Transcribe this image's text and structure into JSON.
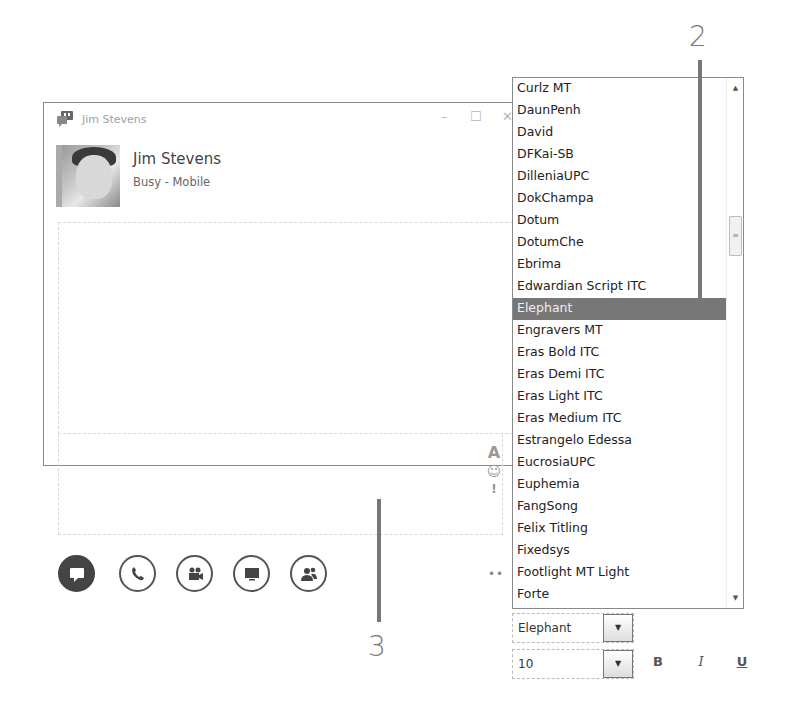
{
  "window": {
    "title": "Jim Stevens",
    "controls": {
      "minimize": "–",
      "maximize": "☐",
      "close": "✕"
    }
  },
  "contact": {
    "name": "Jim Stevens",
    "status": "Busy - Mobile"
  },
  "side_tools": {
    "font": "A",
    "emoticon": "☺",
    "importance": "!"
  },
  "action_buttons": [
    {
      "name": "im-button",
      "icon": "speech-bubble",
      "glyph": "▬",
      "active": true
    },
    {
      "name": "call-button",
      "icon": "phone",
      "glyph": "✆",
      "active": false
    },
    {
      "name": "video-button",
      "icon": "video-camera",
      "glyph": "▰",
      "active": false
    },
    {
      "name": "present-button",
      "icon": "monitor",
      "glyph": "▭",
      "active": false
    },
    {
      "name": "participants-button",
      "icon": "people",
      "glyph": "☻",
      "active": false
    }
  ],
  "more_options": "••",
  "font_list": {
    "items": [
      "Curlz MT",
      "DaunPenh",
      "David",
      "DFKai-SB",
      "DilleniaUPC",
      "DokChampa",
      "Dotum",
      "DotumChe",
      "Ebrima",
      "Edwardian Script ITC",
      "Elephant",
      "Engravers MT",
      "Eras Bold ITC",
      "Eras Demi ITC",
      "Eras Light ITC",
      "Eras Medium ITC",
      "Estrangelo Edessa",
      "EucrosiaUPC",
      "Euphemia",
      "FangSong",
      "Felix Titling",
      "Fixedsys",
      "Footlight MT Light",
      "Forte"
    ],
    "selected": "Elephant",
    "scroll_up": "▲",
    "scroll_down": "▼",
    "thumb_grip": "≡"
  },
  "font_select": {
    "value": "Elephant",
    "arrow": "▼"
  },
  "size_select": {
    "value": "10",
    "arrow": "▼"
  },
  "format_buttons": {
    "bold": "B",
    "italic": "I",
    "underline": "U"
  },
  "callouts": {
    "two": "2",
    "three": "3"
  },
  "colors": {
    "selection": "#777777",
    "border": "#8a8a8a",
    "callout": "#777777"
  }
}
